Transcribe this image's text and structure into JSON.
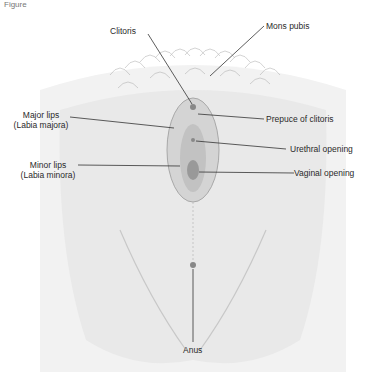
{
  "figure": {
    "header": "Figure",
    "type": "anatomical-illustration",
    "labels": {
      "clitoris": "Clitoris",
      "mons_pubis": "Mons pubis",
      "major_lips": "Major lips",
      "major_lips_latin": "(Labia majora)",
      "prepuce": "Prepuce of clitoris",
      "minor_lips": "Minor lips",
      "minor_lips_latin": "(Labia minora)",
      "urethral_opening": "Urethral opening",
      "vaginal_opening": "Vaginal opening",
      "anus": "Anus"
    },
    "colors": {
      "shading": "#d9d9d9",
      "shading_dark": "#b5b5b5",
      "leader_line": "#333333"
    }
  }
}
